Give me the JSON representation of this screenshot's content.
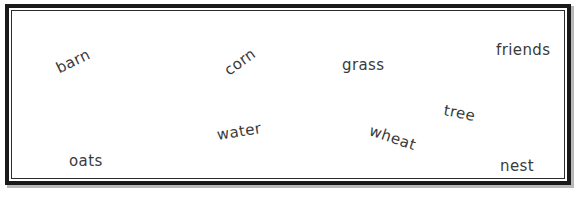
{
  "canvas": {
    "width": 582,
    "height": 198,
    "background_color": "#ffffff"
  },
  "frame": {
    "name": "double-ruled-rectangle",
    "style": "double",
    "outer_color": "#1a1a1a",
    "inner_color": "#2b2b2b",
    "fill_color": "#ffffff",
    "shadow_color": "#b9b9b9"
  },
  "word_field": {
    "text_color": "#3a3a3a",
    "font_size_px": 15,
    "words": [
      {
        "label": "barn",
        "x": 57,
        "y": 60,
        "rotation": -26,
        "size": 15
      },
      {
        "label": "corn",
        "x": 226,
        "y": 63,
        "rotation": -36,
        "size": 15
      },
      {
        "label": "grass",
        "x": 342,
        "y": 56,
        "rotation": 0,
        "size": 15
      },
      {
        "label": "friends",
        "x": 496,
        "y": 41,
        "rotation": 0,
        "size": 15
      },
      {
        "label": "tree",
        "x": 444,
        "y": 101,
        "rotation": 11,
        "size": 15
      },
      {
        "label": "water",
        "x": 217,
        "y": 126,
        "rotation": -9,
        "size": 15
      },
      {
        "label": "wheat",
        "x": 370,
        "y": 121,
        "rotation": 19,
        "size": 15
      },
      {
        "label": "oats",
        "x": 69,
        "y": 152,
        "rotation": 0,
        "size": 15
      },
      {
        "label": "nest",
        "x": 500,
        "y": 157,
        "rotation": 0,
        "size": 15
      }
    ]
  }
}
